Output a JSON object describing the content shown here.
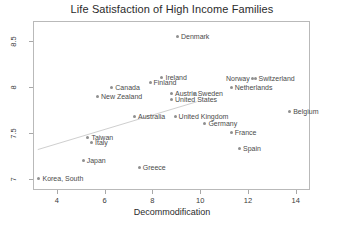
{
  "chart_data": {
    "type": "scatter",
    "title": "Life Satisfaction of High Income Families",
    "xlabel": "Decommodification",
    "ylabel": "",
    "xlim": [
      3.0,
      14.6
    ],
    "ylim": [
      6.88,
      8.72
    ],
    "grid": false,
    "legend": "none",
    "xticks": [
      "4",
      "6",
      "8",
      "10",
      "12",
      "14"
    ],
    "xtick_values": [
      4,
      6,
      8,
      10,
      12,
      14
    ],
    "yticks": [
      "8.5",
      "8",
      "7.5",
      "7"
    ],
    "ytick_values": [
      8.5,
      8,
      7.5,
      7
    ],
    "trendline": {
      "present": true,
      "x_start": 3.2,
      "y_start": 7.32,
      "x_end": 9.85,
      "y_end": 7.84
    },
    "points": [
      {
        "label": "Denmark",
        "x": 9.05,
        "y": 8.55,
        "label_side": "right"
      },
      {
        "label": "Ireland",
        "x": 8.4,
        "y": 8.11,
        "label_side": "right"
      },
      {
        "label": "Norway",
        "x": 12.2,
        "y": 8.09,
        "label_side": "left"
      },
      {
        "label": "Switzerland",
        "x": 12.3,
        "y": 8.09,
        "label_side": "right"
      },
      {
        "label": "Finland",
        "x": 7.9,
        "y": 8.05,
        "label_side": "right"
      },
      {
        "label": "Canada",
        "x": 6.3,
        "y": 8.0,
        "label_side": "right"
      },
      {
        "label": "Netherlands",
        "x": 11.3,
        "y": 8.0,
        "label_side": "right"
      },
      {
        "label": "Austria",
        "x": 8.8,
        "y": 7.93,
        "label_side": "right"
      },
      {
        "label": "Sweden",
        "x": 9.75,
        "y": 7.93,
        "label_side": "right"
      },
      {
        "label": "New Zealand",
        "x": 5.7,
        "y": 7.9,
        "label_side": "right"
      },
      {
        "label": "United States",
        "x": 8.8,
        "y": 7.87,
        "label_side": "right"
      },
      {
        "label": "Belgium",
        "x": 13.75,
        "y": 7.74,
        "label_side": "right"
      },
      {
        "label": "Australia",
        "x": 7.25,
        "y": 7.68,
        "label_side": "right"
      },
      {
        "label": "United Kingdom",
        "x": 8.95,
        "y": 7.68,
        "label_side": "right"
      },
      {
        "label": "Germany",
        "x": 10.2,
        "y": 7.6,
        "label_side": "right"
      },
      {
        "label": "France",
        "x": 11.3,
        "y": 7.51,
        "label_side": "right"
      },
      {
        "label": "Taiwan",
        "x": 5.3,
        "y": 7.45,
        "label_side": "right"
      },
      {
        "label": "Italy",
        "x": 5.45,
        "y": 7.4,
        "label_side": "right"
      },
      {
        "label": "Spain",
        "x": 11.65,
        "y": 7.33,
        "label_side": "right"
      },
      {
        "label": "Japan",
        "x": 5.1,
        "y": 7.2,
        "label_side": "right"
      },
      {
        "label": "Greece",
        "x": 7.45,
        "y": 7.13,
        "label_side": "right"
      },
      {
        "label": "Korea, South",
        "x": 3.25,
        "y": 7.0,
        "label_side": "right"
      }
    ]
  }
}
